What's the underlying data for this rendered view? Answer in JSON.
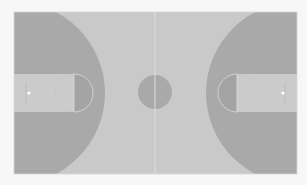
{
  "court": {
    "type": "basketball-court-top-view",
    "bounds": {
      "x": 14,
      "y": 12,
      "width": 283,
      "height": 162
    },
    "colors": {
      "page_background": "#f7f7f7",
      "court_floor": "#c9c9c9",
      "three_point_area": "#a9a9a9",
      "key": "#cbcbcb",
      "free_throw_half_circle": "#a4a4a4",
      "center_circle": "#a9a9a9",
      "lines": "#dcdcdc",
      "basket": "#ffffff"
    },
    "left_half": {
      "three_point_arc": {
        "cx": 14,
        "cy": 93,
        "r": 91
      },
      "key": {
        "x": 14,
        "y": 74,
        "width": 60,
        "height": 38
      },
      "free_throw_circle": {
        "cx": 74,
        "cy": 93,
        "r": 19
      },
      "basket": {
        "cx": 29,
        "cy": 93,
        "r": 1.6
      }
    },
    "right_half": {
      "three_point_arc": {
        "cx": 297,
        "cy": 93,
        "r": 91
      },
      "key": {
        "x": 237,
        "y": 74,
        "width": 60,
        "height": 38
      },
      "free_throw_circle": {
        "cx": 237,
        "cy": 93,
        "r": 19
      },
      "basket": {
        "cx": 283,
        "cy": 93,
        "r": 1.6
      }
    },
    "center_circle": {
      "cx": 155,
      "cy": 92,
      "r": 17
    },
    "midcourt_line": {
      "x": 155,
      "y1": 12,
      "y2": 174
    }
  }
}
